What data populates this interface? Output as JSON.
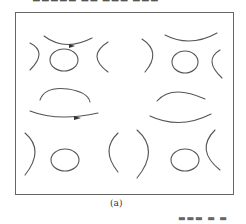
{
  "figure": {
    "caption": "(a)",
    "top_text": "▬▬▬▬▬ ▬▬ ▬▬▬ ▬▬▬",
    "bottom_text": "▬▬▬ ▬ ▬ ▬▬▬",
    "stroke_color": "#555555",
    "frame_color": "#666666"
  }
}
